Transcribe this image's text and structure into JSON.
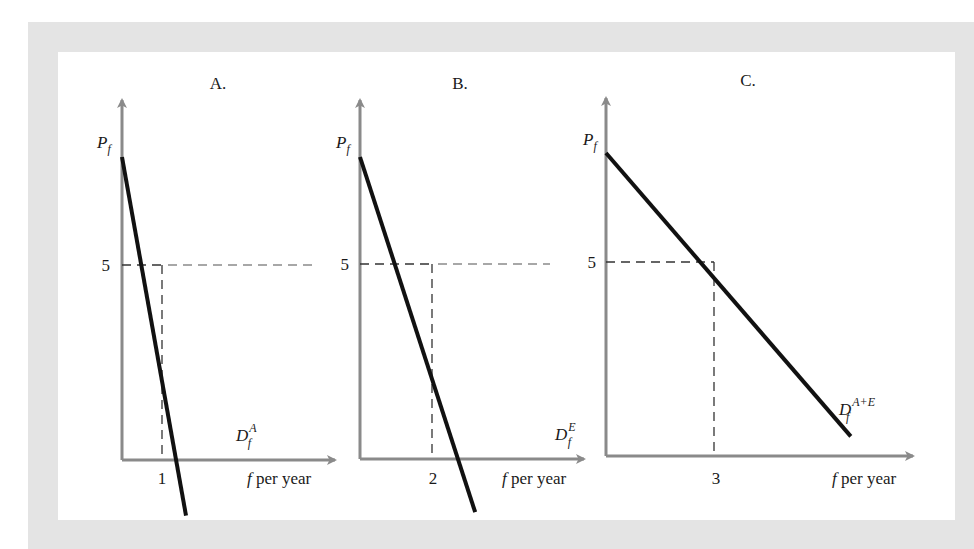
{
  "chart_data": [
    {
      "type": "line",
      "panel": "A.",
      "title": "A.",
      "ylabel": "P",
      "ylabel_sub": "f",
      "xlabel_var": "f",
      "xlabel_rest": " per year",
      "series": [
        {
          "name": "D_f^A",
          "label_main": "D",
          "label_sub": "f",
          "label_sup": "A",
          "points": [
            [
              0,
              7.5
            ],
            [
              1.6,
              -0.8
            ]
          ]
        }
      ],
      "reference": {
        "price": 5,
        "quantity": 1,
        "price_label": "5",
        "quantity_label": "1",
        "hline_extends": true
      },
      "xlim": [
        0,
        4.3
      ],
      "ylim": [
        -1,
        9.6
      ]
    },
    {
      "type": "line",
      "panel": "B.",
      "title": "B.",
      "ylabel": "P",
      "ylabel_sub": "f",
      "xlabel_var": "f",
      "xlabel_rest": " per year",
      "series": [
        {
          "name": "D_f^E",
          "label_main": "D",
          "label_sub": "f",
          "label_sup": "E",
          "points": [
            [
              0,
              7.5
            ],
            [
              3.2,
              -0.8
            ]
          ]
        }
      ],
      "reference": {
        "price": 5,
        "quantity": 2,
        "price_label": "5",
        "quantity_label": "2",
        "hline_extends": true
      },
      "xlim": [
        0,
        6.3
      ],
      "ylim": [
        -1,
        9.6
      ]
    },
    {
      "type": "line",
      "panel": "C.",
      "title": "C.",
      "ylabel": "P",
      "ylabel_sub": "f",
      "xlabel_var": "f",
      "xlabel_rest": " per year",
      "series": [
        {
          "name": "D_f^{A+E}",
          "label_main": "D",
          "label_sub": "f",
          "label_sup": "A+E",
          "points": [
            [
              0,
              7.5
            ],
            [
              6.8,
              1.0
            ]
          ]
        }
      ],
      "reference": {
        "price": 5,
        "quantity": 3,
        "price_label": "5",
        "quantity_label": "3",
        "hline_extends": false
      },
      "xlim": [
        0,
        8.3
      ],
      "ylim": [
        -1,
        9.6
      ]
    }
  ]
}
